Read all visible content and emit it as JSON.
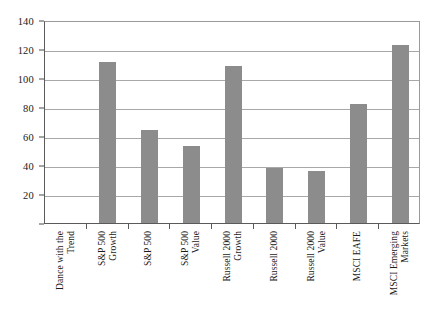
{
  "chart_data": {
    "type": "bar",
    "title": "",
    "subtitle": "",
    "xlabel": "",
    "ylabel": "",
    "ylim": [
      0,
      140
    ],
    "ytick_values": [
      0,
      20,
      40,
      60,
      80,
      100,
      120,
      140
    ],
    "ytick_labels": [
      "",
      "20",
      "40",
      "60",
      "80",
      "100",
      "120",
      "140"
    ],
    "grid": true,
    "legend": "none",
    "bar_color": "#8c8c8c",
    "categories": [
      "Dance with the Trend",
      "S&P 500 Growth",
      "S&P 500",
      "S&P 500 Value",
      "Russell 2000 Growth",
      "Russell 2000",
      "Russell 2000 Value",
      "MSCI EAFE",
      "MSCI Emerging Markets"
    ],
    "category_label_lines": [
      [
        "Dance with the",
        "Trend"
      ],
      [
        "S&P 500",
        "Growth"
      ],
      [
        "S&P 500"
      ],
      [
        "S&P 500",
        "Value"
      ],
      [
        "Russell 2000",
        "Growth"
      ],
      [
        "Russell 2000"
      ],
      [
        "Russell 2000",
        "Value"
      ],
      [
        "MSCI EAFE"
      ],
      [
        "MSCI Emerging",
        "Markets"
      ]
    ],
    "values": [
      0,
      111,
      64,
      53,
      108,
      38,
      36,
      82,
      123
    ]
  }
}
